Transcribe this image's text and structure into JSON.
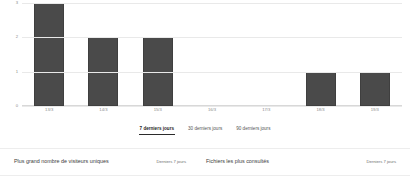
{
  "chart_data": {
    "type": "bar",
    "title": "",
    "xlabel": "",
    "ylabel": "",
    "categories": [
      "13/3",
      "14/3",
      "15/3",
      "16/3",
      "17/3",
      "18/3",
      "19/3"
    ],
    "values": [
      3,
      2,
      2,
      0,
      0,
      1,
      1
    ],
    "ylim": [
      0,
      3
    ],
    "yticks": [
      "3",
      "2",
      "1",
      "0"
    ],
    "ytick_values": [
      3,
      2,
      1,
      0
    ],
    "grid": true,
    "legend": "none",
    "bar_color": "#4a4a4a"
  },
  "range_tabs": [
    {
      "label": "7 derniers jours",
      "active": true
    },
    {
      "label": "30 derniers jours",
      "active": false
    },
    {
      "label": "90 derniers jours",
      "active": false
    }
  ],
  "footer": {
    "sections": [
      {
        "title": "Plus grand nombre de visiteurs uniques",
        "period": "Derniers 7 jours"
      },
      {
        "title": "Fichiers les plus consultés",
        "period": "Derniers 7 jours"
      }
    ]
  },
  "colors": {
    "bar": "#4a4a4a",
    "gridline": "#e9e9e9",
    "divider": "#ededed",
    "tick_text": "#8a8a8a"
  }
}
